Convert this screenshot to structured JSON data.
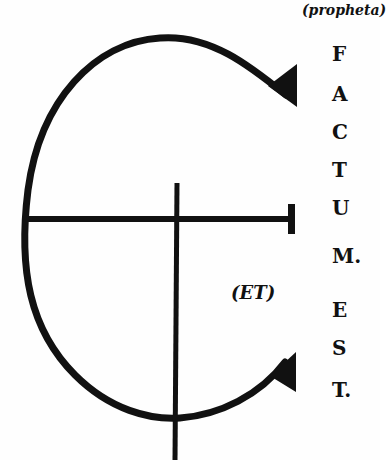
{
  "figure": {
    "annotation_top": "(propheta)",
    "annotation_center": "(ET)",
    "vertical_letters": [
      {
        "char": "F",
        "top": 44
      },
      {
        "char": "A",
        "top": 84
      },
      {
        "char": "C",
        "top": 122
      },
      {
        "char": "T",
        "top": 160
      },
      {
        "char": "U",
        "top": 198
      },
      {
        "char": "M.",
        "top": 246
      },
      {
        "char": "E",
        "top": 300
      },
      {
        "char": "S",
        "top": 338
      },
      {
        "char": "T.",
        "top": 380
      }
    ],
    "phrase": "FACTUM EST.",
    "colors": {
      "ink": "#111111",
      "paper": "#fefefe"
    }
  }
}
